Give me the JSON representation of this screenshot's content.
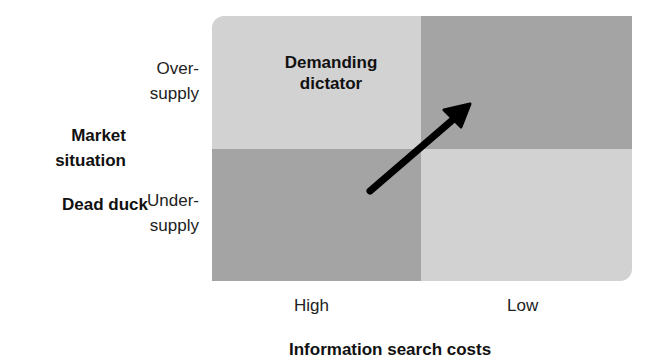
{
  "diagram": {
    "type": "2x2 matrix",
    "y_axis": {
      "title": [
        "Market",
        "situation"
      ],
      "labels": [
        {
          "line1": "Over-",
          "line2": "supply"
        },
        {
          "line1": "Under-",
          "line2": "supply"
        }
      ]
    },
    "x_axis": {
      "title": "Information search costs",
      "labels": [
        "High",
        "Low"
      ]
    },
    "quadrants": {
      "top_left": "",
      "top_right": {
        "line1": "Demanding",
        "line2": "dictator"
      },
      "bottom_left": "Dead duck",
      "bottom_right": ""
    },
    "arrow": {
      "from": "Dead duck",
      "to": "Demanding dictator"
    },
    "colors": {
      "light_quadrant": "#d2d2d2",
      "dark_quadrant": "#a4a4a4",
      "arrow": "#000000"
    }
  }
}
